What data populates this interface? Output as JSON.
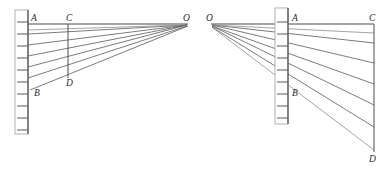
{
  "figure": {
    "background_color": "#ffffff",
    "width": 385,
    "height": 170,
    "stroke_colors": {
      "ray": "#595959",
      "ray_light": "#8c8c8c",
      "axis": "#4a4a4a",
      "scale_outline": "#a8a8a8",
      "scale_spine": "#555555",
      "label": "#2b2b2b"
    },
    "panels": [
      {
        "id": "left-panel",
        "name": "left-diagram",
        "description": "Scale on the left, rays converging to vanishing point O on the right",
        "vanishing_point": {
          "label": "O",
          "x": 188,
          "y": 24
        },
        "scale": {
          "name": "left-scale",
          "spine_x": 28,
          "top_y": 10,
          "bottom_y": 134,
          "body_left": 15,
          "body_right": 28,
          "tick_length": 11,
          "tick_direction": "left",
          "tick_ys": [
            22,
            34,
            46,
            58,
            70,
            82,
            94,
            106,
            118,
            130
          ]
        },
        "labels": [
          {
            "text": "A",
            "x": 31,
            "y": 21,
            "name": "point-label-a"
          },
          {
            "text": "B",
            "x": 34,
            "y": 96,
            "name": "point-label-b"
          },
          {
            "text": "C",
            "x": 66,
            "y": 21,
            "name": "point-label-c"
          },
          {
            "text": "D",
            "x": 66,
            "y": 86,
            "name": "point-label-d"
          },
          {
            "text": "O",
            "x": 183,
            "y": 21,
            "name": "point-label-o"
          }
        ],
        "vertical_segment": {
          "name": "segment-cd-left",
          "x": 68,
          "y1": 24,
          "y2": 78
        },
        "baseline": {
          "name": "baseline-ao-left",
          "x1": 28,
          "y1": 24,
          "x2": 188,
          "y2": 24
        },
        "rays": [
          {
            "name": "ray-1",
            "from_x": 28,
            "from_y": 24
          },
          {
            "name": "ray-2",
            "from_x": 28,
            "from_y": 34
          },
          {
            "name": "ray-3",
            "from_x": 28,
            "from_y": 45
          },
          {
            "name": "ray-4",
            "from_x": 28,
            "from_y": 56
          },
          {
            "name": "ray-5",
            "from_x": 28,
            "from_y": 67
          },
          {
            "name": "ray-6",
            "from_x": 28,
            "from_y": 78
          },
          {
            "name": "ray-7",
            "from_x": 30,
            "from_y": 90
          }
        ]
      },
      {
        "id": "right-panel",
        "name": "right-diagram",
        "description": "Vanishing point O on the left, scale in the middle, rays diverging down-right to line CD",
        "vanishing_point": {
          "label": "O",
          "x": 211,
          "y": 24
        },
        "scale": {
          "name": "right-scale",
          "spine_x": 288,
          "top_y": 8,
          "bottom_y": 124,
          "body_left": 275,
          "body_right": 288,
          "tick_length": 11,
          "tick_direction": "left",
          "tick_ys": [
            22,
            34,
            46,
            58,
            70,
            82,
            94,
            106,
            118
          ]
        },
        "labels": [
          {
            "text": "O",
            "x": 206,
            "y": 21,
            "name": "point-label-o"
          },
          {
            "text": "A",
            "x": 292,
            "y": 21,
            "name": "point-label-a"
          },
          {
            "text": "B",
            "x": 292,
            "y": 96,
            "name": "point-label-b"
          },
          {
            "text": "C",
            "x": 369,
            "y": 21,
            "name": "point-label-c"
          },
          {
            "text": "D",
            "x": 369,
            "y": 162,
            "name": "point-label-d"
          }
        ],
        "vertical_segment": {
          "name": "segment-cd-right",
          "x": 374,
          "y1": 24,
          "y2": 152
        },
        "baseline": {
          "name": "baseline-oc-right",
          "x1": 211,
          "y1": 24,
          "x2": 374,
          "y2": 24
        },
        "rays": [
          {
            "name": "ray-1",
            "to_x": 374,
            "to_y": 24
          },
          {
            "name": "ray-2",
            "to_x": 374,
            "to_y": 43
          },
          {
            "name": "ray-3",
            "to_x": 374,
            "to_y": 63
          },
          {
            "name": "ray-4",
            "to_x": 374,
            "to_y": 84
          },
          {
            "name": "ray-5",
            "to_x": 374,
            "to_y": 105
          },
          {
            "name": "ray-6",
            "to_x": 374,
            "to_y": 127
          },
          {
            "name": "ray-7",
            "to_x": 374,
            "to_y": 150
          }
        ]
      }
    ]
  }
}
